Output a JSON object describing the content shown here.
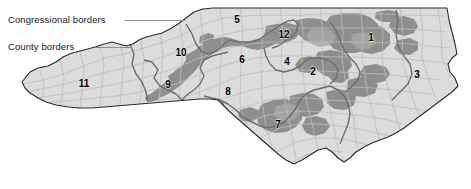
{
  "figure": {
    "kind": "choropleth-map",
    "background_color": "#ffffff",
    "width": 471,
    "height": 189
  },
  "colors": {
    "land_base": "#dcdcdc",
    "land_light": "#e4e4e4",
    "shaded_area": "#8f8f8f",
    "shaded_area_mid": "#9d9d9d",
    "county_border": "#b4b4b4",
    "congressional_border": "#6e6e6e",
    "state_outline": "#2b2b2b",
    "leader_line": "#8f8f8f",
    "label_text": "#1a1a1a",
    "number_text": "#000000"
  },
  "legend": {
    "items": [
      {
        "id": "congressional",
        "label": "Congressional borders",
        "label_x": 8,
        "label_y": 14,
        "leader_x": 125,
        "leader_y": 20,
        "leader_width": 60
      },
      {
        "id": "county",
        "label": "County borders",
        "label_x": 8,
        "label_y": 41,
        "leader_x": 96,
        "leader_y": 47,
        "leader_width": 36
      }
    ]
  },
  "districts": [
    {
      "number": "1",
      "x": 371,
      "y": 38
    },
    {
      "number": "2",
      "x": 313,
      "y": 72
    },
    {
      "number": "3",
      "x": 417,
      "y": 75
    },
    {
      "number": "4",
      "x": 287,
      "y": 62
    },
    {
      "number": "5",
      "x": 237,
      "y": 20
    },
    {
      "number": "6",
      "x": 242,
      "y": 60
    },
    {
      "number": "7",
      "x": 278,
      "y": 125
    },
    {
      "number": "8",
      "x": 228,
      "y": 92
    },
    {
      "number": "9",
      "x": 168,
      "y": 85
    },
    {
      "number": "10",
      "x": 181,
      "y": 53
    },
    {
      "number": "11",
      "x": 84,
      "y": 84
    },
    {
      "number": "12",
      "x": 284,
      "y": 35
    }
  ]
}
